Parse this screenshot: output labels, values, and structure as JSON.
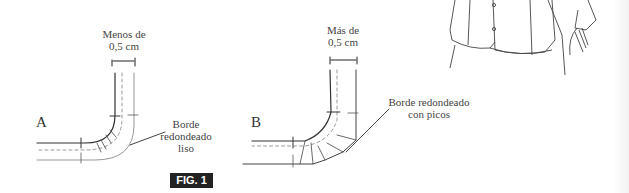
{
  "figure": {
    "label": "FIG. 1",
    "panel_a": {
      "letter": "A",
      "measure_line1": "Menos de",
      "measure_line2": "0,5 cm",
      "callout_line1": "Borde",
      "callout_line2": "redondeado",
      "callout_line3": "liso"
    },
    "panel_b": {
      "letter": "B",
      "measure_line1": "Más de",
      "measure_line2": "0,5 cm",
      "callout_line1": "Borde redondeado",
      "callout_line2": "con picos"
    }
  },
  "illustration": {
    "subject": "jacket-with-rounded-hem"
  }
}
